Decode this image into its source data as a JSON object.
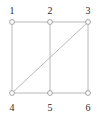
{
  "figure": {
    "title": "",
    "type": "graph-diagram",
    "width": 97,
    "height": 115,
    "background_color": "#ffffff"
  },
  "style": {
    "edge_color": "#b0b0b0",
    "edge_width": 0.9,
    "node_stroke_color": "#9a9a9a",
    "node_fill_color": "#ffffff",
    "node_radius": 2.4,
    "label_color": "#2b2b2b",
    "label_font_size": 10
  },
  "graph_data": {
    "type": "graph",
    "directed": false,
    "node_count": 6,
    "edge_count": 8,
    "nodes": [
      {
        "id": "1",
        "label": "1",
        "x": 12,
        "y": 22,
        "label_x": 12,
        "label_y": 14
      },
      {
        "id": "2",
        "label": "2",
        "x": 50,
        "y": 22,
        "label_x": 50,
        "label_y": 14
      },
      {
        "id": "3",
        "label": "3",
        "x": 88,
        "y": 22,
        "label_x": 88,
        "label_y": 14
      },
      {
        "id": "4",
        "label": "4",
        "x": 12,
        "y": 93,
        "label_x": 12,
        "label_y": 111
      },
      {
        "id": "5",
        "label": "5",
        "x": 50,
        "y": 93,
        "label_x": 50,
        "label_y": 111
      },
      {
        "id": "6",
        "label": "6",
        "x": 88,
        "y": 93,
        "label_x": 88,
        "label_y": 111
      }
    ],
    "edges": [
      {
        "source": "1",
        "target": "2",
        "kind": "horizontal-top"
      },
      {
        "source": "2",
        "target": "3",
        "kind": "horizontal-top"
      },
      {
        "source": "4",
        "target": "5",
        "kind": "horizontal-bottom"
      },
      {
        "source": "5",
        "target": "6",
        "kind": "horizontal-bottom"
      },
      {
        "source": "1",
        "target": "4",
        "kind": "vertical-left"
      },
      {
        "source": "2",
        "target": "5",
        "kind": "vertical-middle"
      },
      {
        "source": "3",
        "target": "6",
        "kind": "vertical-right"
      },
      {
        "source": "4",
        "target": "3",
        "kind": "diagonal"
      }
    ]
  }
}
